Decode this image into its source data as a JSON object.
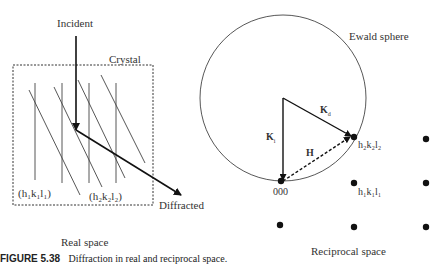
{
  "real_space": {
    "labels": {
      "incident": "Incident",
      "crystal": "Crystal",
      "plane1": "(h₁k₁l₁)",
      "plane2": "(h₂k₂l₂)",
      "diffracted": "Diffracted",
      "title": "Real space"
    }
  },
  "reciprocal_space": {
    "labels": {
      "ewald": "Ewald sphere",
      "kd": "K",
      "kd_sub": "d",
      "ki": "K",
      "ki_sub": "i",
      "h": "H",
      "origin": "000",
      "point2": "h₂k₂l₂",
      "point1": "h₁k₁l₁",
      "title": "Reciprocal space"
    }
  },
  "caption": {
    "figure_number": "FIGURE 5.38",
    "text": "Diffraction in real and reciprocal space."
  }
}
